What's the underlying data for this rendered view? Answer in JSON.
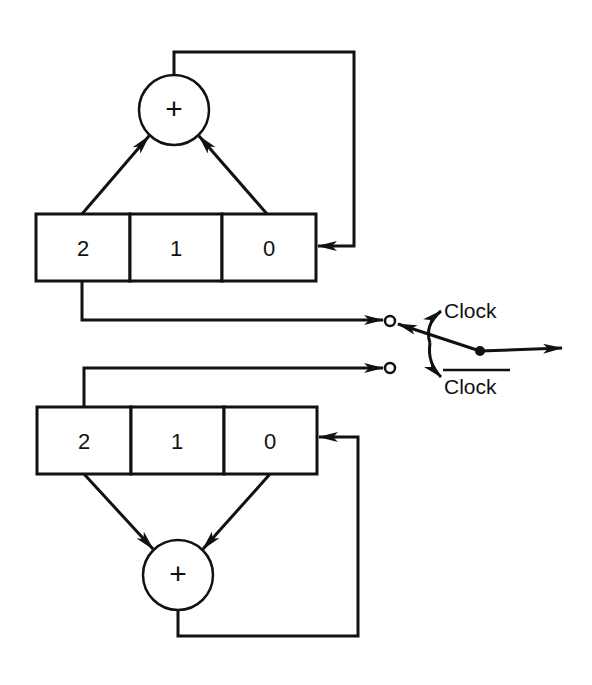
{
  "diagram": {
    "top_register": {
      "cells": [
        {
          "label": "2"
        },
        {
          "label": "1"
        },
        {
          "label": "0"
        }
      ],
      "adder_symbol": "+"
    },
    "bottom_register": {
      "cells": [
        {
          "label": "2"
        },
        {
          "label": "1"
        },
        {
          "label": "0"
        }
      ],
      "adder_symbol": "+"
    },
    "switch": {
      "upper_label": "Clock",
      "lower_label": "Clock",
      "lower_label_overline": true
    },
    "colors": {
      "ink": "#111111",
      "background": "#ffffff"
    }
  }
}
